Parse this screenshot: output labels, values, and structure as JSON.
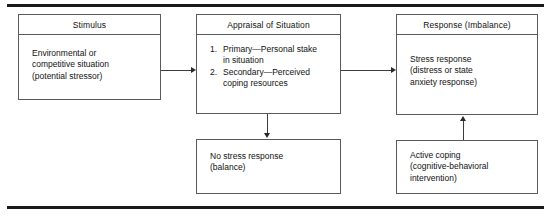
{
  "figure": {
    "rule_color": "#1a1a1a",
    "box_border_color": "#5a5a5a",
    "connector_color": "#3c3c3c"
  },
  "boxes": {
    "stimulus": {
      "header": "Stimulus",
      "body_lines": [
        "Environmental or",
        "competitive situation",
        "(potential stressor)"
      ]
    },
    "appraisal": {
      "header": "Appraisal of Situation",
      "items": [
        {
          "num": "1.",
          "lines": [
            "Primary—Personal stake",
            "in situation"
          ]
        },
        {
          "num": "2.",
          "lines": [
            "Secondary—Perceived",
            "coping resources"
          ]
        }
      ]
    },
    "response": {
      "header": "Response (Imbalance)",
      "body_lines": [
        "Stress response",
        "(distress or state",
        "anxiety response)"
      ]
    },
    "no_stress": {
      "body_lines": [
        "No stress response",
        "(balance)"
      ]
    },
    "active_coping": {
      "body_lines": [
        "Active coping",
        "(cognitive-behavioral",
        "intervention)"
      ]
    }
  },
  "connectors": [
    {
      "name": "stimulus-to-appraisal",
      "direction": "right"
    },
    {
      "name": "appraisal-to-response",
      "direction": "right"
    },
    {
      "name": "appraisal-to-no-stress",
      "direction": "down"
    },
    {
      "name": "active-coping-to-response",
      "direction": "up"
    }
  ]
}
